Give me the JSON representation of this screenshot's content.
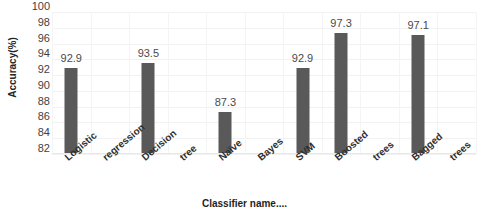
{
  "chart_data": {
    "type": "bar",
    "title": "",
    "xlabel": "Classifier name....",
    "ylabel": "Accuracy(%)",
    "ylim": [
      82,
      100
    ],
    "ytick_step": 2,
    "yticks": [
      100,
      98,
      96,
      94,
      92,
      90,
      88,
      86,
      84,
      82
    ],
    "grid": true,
    "grid_orientation": "both",
    "legend": "none",
    "categories": [
      "Logistic",
      "regression",
      "Decision",
      "tree",
      "Naïve",
      "Bayes",
      "SVM",
      "Boosted",
      "trees",
      "Bagged",
      "trees"
    ],
    "classifier_names": [
      "Logistic regression",
      "Decision tree",
      "Naïve Bayes",
      "SVM",
      "Boosted trees",
      "Bagged trees"
    ],
    "values": [
      92.9,
      null,
      93.5,
      null,
      87.3,
      null,
      92.9,
      97.3,
      null,
      97.1,
      null
    ],
    "bars": [
      {
        "category_index": 0,
        "label": "Logistic",
        "value": 92.9,
        "data_label": "92.9"
      },
      {
        "category_index": 2,
        "label": "Decision",
        "value": 93.5,
        "data_label": "93.5"
      },
      {
        "category_index": 4,
        "label": "Naïve",
        "value": 87.3,
        "data_label": "87.3"
      },
      {
        "category_index": 6,
        "label": "SVM",
        "value": 92.9,
        "data_label": "92.9"
      },
      {
        "category_index": 7,
        "label": "Boosted",
        "value": 97.3,
        "data_label": "97.3"
      },
      {
        "category_index": 9,
        "label": "Bagged",
        "value": 97.1,
        "data_label": "97.1"
      }
    ],
    "colors": {
      "bar_fill": "#595959",
      "background": "#ffffff",
      "gridline": "#f2f2f2",
      "axis_text": "#3f3f3f",
      "title_text": "#1f1f1f"
    }
  }
}
